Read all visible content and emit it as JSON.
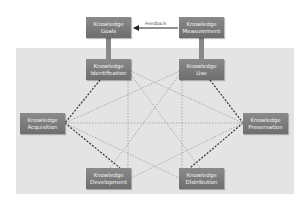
{
  "diagram": {
    "nodes": [
      {
        "id": "goals",
        "line1": "Knowledge",
        "line2": "Goals"
      },
      {
        "id": "measurement",
        "line1": "Knowledge",
        "line2": "Measurement"
      },
      {
        "id": "identification",
        "line1": "Knowledge",
        "line2": "Identification"
      },
      {
        "id": "use",
        "line1": "Knowledge",
        "line2": "Use"
      },
      {
        "id": "acquisition",
        "line1": "Knowledge",
        "line2": "Acquisition"
      },
      {
        "id": "preservation",
        "line1": "Knowledge",
        "line2": "Preservation"
      },
      {
        "id": "development",
        "line1": "Knowledge",
        "line2": "Development"
      },
      {
        "id": "distribution",
        "line1": "Knowledge",
        "line2": "Distribution"
      }
    ],
    "feedback_label": "Feedback",
    "colors": {
      "node": "#7a7a7a",
      "background": "#e4e4e4",
      "strong_edge": "#333333",
      "weak_edge": "#9a9a9a"
    }
  }
}
